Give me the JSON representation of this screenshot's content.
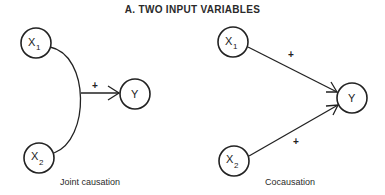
{
  "title": "A. TWO INPUT VARIABLES",
  "panels": [
    {
      "caption": "Joint causation",
      "nodes": [
        {
          "id": "X1",
          "label": "X",
          "subscript": "1"
        },
        {
          "id": "X2",
          "label": "X",
          "subscript": "2"
        },
        {
          "id": "Y",
          "label": "Y",
          "subscript": ""
        }
      ],
      "edges": [
        {
          "from": [
            "X1",
            "X2"
          ],
          "to": "Y",
          "sign": "+",
          "type": "joint"
        }
      ]
    },
    {
      "caption": "Cocausation",
      "nodes": [
        {
          "id": "X1",
          "label": "X",
          "subscript": "1"
        },
        {
          "id": "X2",
          "label": "X",
          "subscript": "2"
        },
        {
          "id": "Y",
          "label": "Y",
          "subscript": ""
        }
      ],
      "edges": [
        {
          "from": "X1",
          "to": "Y",
          "sign": "+"
        },
        {
          "from": "X2",
          "to": "Y",
          "sign": "+"
        }
      ]
    }
  ]
}
